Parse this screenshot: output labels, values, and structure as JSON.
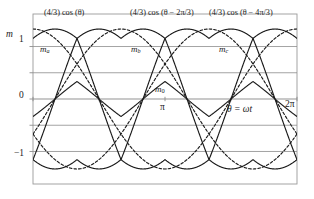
{
  "figure": {
    "caption_title": "Three-phase SVPWM modulation functions"
  },
  "axes": {
    "ylabel": "m",
    "xlabel": "θ = ωt",
    "ytick_1": "1",
    "ytick_0": "0",
    "ytick_m1": "−1",
    "xtick_pi": "π",
    "xtick_2pi": "2π"
  },
  "annotations": {
    "eq_a": "(4/3) cos (θ)",
    "eq_b": "(4/3) cos (θ − 2π/3)",
    "eq_c": "(4/3) cos (θ − 4π/3)",
    "m_a_base": "m",
    "m_a_sub": "a",
    "m_b_base": "m",
    "m_b_sub": "b",
    "m_c_base": "m",
    "m_c_sub": "c",
    "m_0_base": "m",
    "m_0_sub": "0"
  },
  "colors": {
    "curve": "#1a1a1a",
    "grid": "#8c8c8c",
    "frame": "#9a9a9a",
    "background": "#ffffff"
  },
  "chart_data": {
    "type": "line",
    "xlabel": "θ = ωt",
    "ylabel": "m",
    "xlim": [
      0,
      6.283185
    ],
    "ylim": [
      -1.62,
      1.62
    ],
    "xticks": [
      0,
      1.570796,
      3.141593,
      4.712389,
      6.283185
    ],
    "xticklabels": [
      "",
      "",
      "π",
      "",
      "2π"
    ],
    "yticks": [
      1,
      0.5,
      0,
      -0.5,
      -1
    ],
    "yticklabels": [
      "1",
      "",
      "0",
      "",
      "−1"
    ],
    "grid": "horizontal",
    "legend": "inline-annotations",
    "series": [
      {
        "name": "(4/3) cos (θ)",
        "style": "dashed",
        "kind": "sinusoid",
        "amplitude": 1.3333,
        "phase_deg": 0,
        "description": "reference sinusoid phase a, amplitude 4/3"
      },
      {
        "name": "(4/3) cos (θ − 2π/3)",
        "style": "dashed",
        "kind": "sinusoid",
        "amplitude": 1.3333,
        "phase_deg": -120,
        "description": "reference sinusoid phase b, amplitude 4/3"
      },
      {
        "name": "(4/3) cos (θ − 4π/3)",
        "style": "dashed",
        "kind": "sinusoid",
        "amplitude": 1.3333,
        "phase_deg": -240,
        "description": "reference sinusoid phase c, amplitude 4/3"
      },
      {
        "name": "m_a",
        "style": "solid",
        "kind": "svpwm",
        "amplitude": 1.3333,
        "phase_deg": 0,
        "description": "phase a modulation, sinusoid plus zero-sequence triangle, peak 4/3 at 0 and 2pi"
      },
      {
        "name": "m_b",
        "style": "solid",
        "kind": "svpwm",
        "amplitude": 1.3333,
        "phase_deg": -120,
        "description": "phase b modulation, peak 4/3 at 2pi/3"
      },
      {
        "name": "m_c",
        "style": "solid",
        "kind": "svpwm",
        "amplitude": 1.3333,
        "phase_deg": -240,
        "description": "phase c modulation, peak 4/3 at 4pi/3"
      },
      {
        "name": "m_0",
        "style": "solid",
        "kind": "zero-sequence-triangle",
        "amplitude": 0.3333,
        "period": 2.094395,
        "description": "zero-sequence triangular wave, amplitude 1/3, six times fundamental"
      }
    ],
    "key_values": {
      "sinusoid_peak": 1.333,
      "svpwm_crossing_level": 0.667,
      "svpwm_lower_crossing_level": -0.667,
      "zero_sequence_peak": 0.333,
      "zero_sequence_trough": -0.333
    }
  }
}
